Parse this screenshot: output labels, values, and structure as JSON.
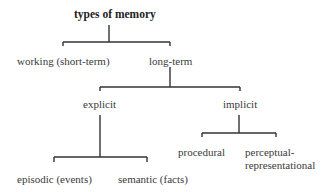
{
  "diagram": {
    "title": "types of memory",
    "level1": {
      "working": "working (short-term)",
      "long_term": "long-term"
    },
    "level2": {
      "explicit": "explicit",
      "implicit": "implicit"
    },
    "level3_explicit": {
      "episodic": "episodic (events)",
      "semantic": "semantic (facts)"
    },
    "level3_implicit": {
      "procedural": "procedural",
      "perceptual_line1": "perceptual-",
      "perceptual_line2": "representational"
    },
    "colors": {
      "line": "#333333",
      "text": "#3a3a3a",
      "background": "#ffffff"
    }
  }
}
